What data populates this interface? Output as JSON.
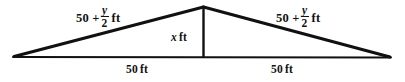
{
  "figure": {
    "name": "isosceles-triangle-diagram",
    "shape": "triangle",
    "background_color": "#ffffff",
    "stroke_color": "#111111",
    "labels": {
      "left_side": {
        "prefix": "50 +",
        "numerator": "y",
        "denominator": "2",
        "unit": "ft",
        "plain": "50 + y/2 ft"
      },
      "right_side": {
        "prefix": "50 +",
        "numerator": "y",
        "denominator": "2",
        "unit": "ft",
        "plain": "50 + y/2 ft"
      },
      "height": {
        "variable": "x",
        "unit": "ft",
        "plain": "x ft"
      },
      "base_left": {
        "value": "50",
        "unit": "ft",
        "plain": "50 ft"
      },
      "base_right": {
        "value": "50",
        "unit": "ft",
        "plain": "50 ft"
      }
    },
    "geometry": {
      "apex": "203,7",
      "left_vertex": "14,57",
      "right_vertex": "390,57",
      "base_midpoint": "203,57"
    }
  }
}
